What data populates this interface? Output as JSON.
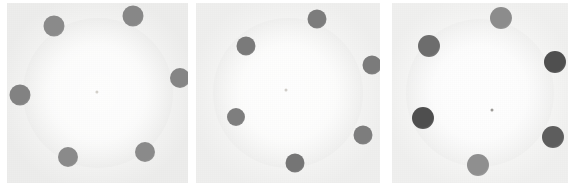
{
  "figure": {
    "width": 574,
    "height": 186,
    "background": "#ffffff"
  },
  "colors": {
    "panel_background": "#f3f3f2",
    "panel_background_edge": "#ededec",
    "halo_inner": "#fbfbfa",
    "halo_outer": "#eeeeed",
    "spot_light_gray": "#8c8c8c",
    "spot_mid_gray": "#7d7d7d",
    "spot_dark_gray": "#6d6d6d",
    "spot_darkest": "#4a4a4a",
    "center_dot": "#cfcfcf"
  },
  "panels": [
    {
      "id": "panel-1",
      "label": "Panel 1",
      "x": 7,
      "y": 3,
      "width": 181,
      "height": 180,
      "background": "#f3f3f2",
      "halo": {
        "diameter": 150,
        "inner": "#fbfbfa",
        "outer": "#ededec"
      },
      "center_dot": {
        "cx": 97,
        "cy": 92,
        "r": 1.6,
        "color": "#d2cfc9"
      },
      "spots": [
        {
          "name": "spot-1",
          "cx": 133,
          "cy": 16,
          "r": 10.5,
          "color": "#878787"
        },
        {
          "name": "spot-2",
          "cx": 54,
          "cy": 26,
          "r": 10.5,
          "color": "#8a8a8a"
        },
        {
          "name": "spot-3",
          "cx": 20,
          "cy": 95,
          "r": 10.5,
          "color": "#828282"
        },
        {
          "name": "spot-4",
          "cx": 68,
          "cy": 157,
          "r": 10.0,
          "color": "#8a8a8a"
        },
        {
          "name": "spot-5",
          "cx": 145,
          "cy": 152,
          "r": 10.0,
          "color": "#8a8a8a"
        },
        {
          "name": "spot-6",
          "cx": 180,
          "cy": 78,
          "r": 10.0,
          "color": "#858585"
        }
      ]
    },
    {
      "id": "panel-2",
      "label": "Panel 2",
      "x": 196,
      "y": 3,
      "width": 184,
      "height": 180,
      "background": "#f4f4f3",
      "halo": {
        "diameter": 150,
        "inner": "#fcfcfb",
        "outer": "#efefee"
      },
      "center_dot": {
        "cx": 286,
        "cy": 90,
        "r": 1.5,
        "color": "#cfccc7"
      },
      "spots": [
        {
          "name": "spot-1",
          "cx": 317,
          "cy": 19,
          "r": 9.5,
          "color": "#7c7c7c"
        },
        {
          "name": "spot-2",
          "cx": 246,
          "cy": 46,
          "r": 9.5,
          "color": "#7a7a7a"
        },
        {
          "name": "spot-3",
          "cx": 236,
          "cy": 117,
          "r": 9.0,
          "color": "#7e7e7e"
        },
        {
          "name": "spot-4",
          "cx": 295,
          "cy": 163,
          "r": 9.5,
          "color": "#757575"
        },
        {
          "name": "spot-5",
          "cx": 363,
          "cy": 135,
          "r": 9.5,
          "color": "#7d7d7d"
        },
        {
          "name": "spot-6",
          "cx": 372,
          "cy": 65,
          "r": 9.5,
          "color": "#7b7b7b"
        }
      ]
    },
    {
      "id": "panel-3",
      "label": "Panel 3",
      "x": 392,
      "y": 3,
      "width": 176,
      "height": 180,
      "background": "#f5f5f4",
      "halo": {
        "diameter": 148,
        "inner": "#fcfcfc",
        "outer": "#f0f0ef"
      },
      "center_dot": {
        "cx": 492,
        "cy": 110,
        "r": 1.5,
        "color": "#9c9a96"
      },
      "spots": [
        {
          "name": "spot-1",
          "cx": 501,
          "cy": 18,
          "r": 11.0,
          "color": "#8c8c8c"
        },
        {
          "name": "spot-2",
          "cx": 429,
          "cy": 46,
          "r": 11.0,
          "color": "#6d6d6d"
        },
        {
          "name": "spot-3",
          "cx": 423,
          "cy": 118,
          "r": 11.0,
          "color": "#4e4e4e"
        },
        {
          "name": "spot-4",
          "cx": 478,
          "cy": 165,
          "r": 11.0,
          "color": "#8f8f8f"
        },
        {
          "name": "spot-5",
          "cx": 553,
          "cy": 137,
          "r": 11.0,
          "color": "#5d5d5d"
        },
        {
          "name": "spot-6",
          "cx": 555,
          "cy": 62,
          "r": 11.0,
          "color": "#4f4f4f"
        }
      ]
    }
  ]
}
